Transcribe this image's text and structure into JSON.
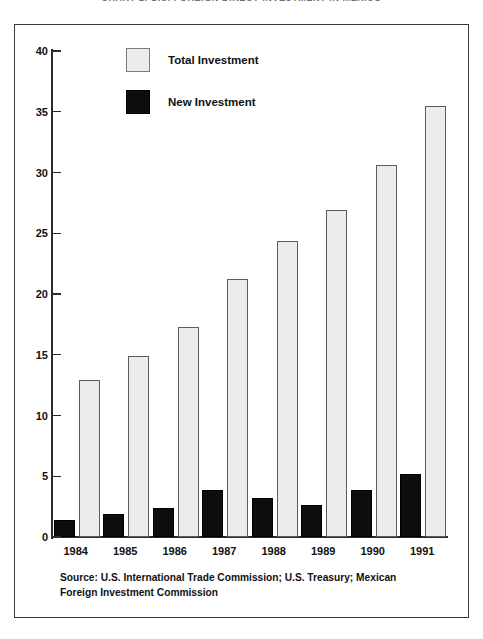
{
  "page": {
    "cropped_title": "CHART 2. U.S. FOREIGN DIRECT INVESTMENT IN MEXICO"
  },
  "legend": {
    "position": "top-center-inside",
    "items": [
      {
        "label": "Total Investment",
        "swatch": "light-gray-square",
        "color": "#ececed"
      },
      {
        "label": "New Investment",
        "swatch": "black-square",
        "color": "#0d0d0d"
      }
    ]
  },
  "source_note": "Source: U.S. International Trade Commission; U.S. Treasury; Mexican Foreign Investment Commission",
  "axis": {
    "y_ticks": [
      "0",
      "5",
      "10",
      "15",
      "20",
      "25",
      "30",
      "35",
      "40"
    ],
    "x_ticks": [
      "1984",
      "1985",
      "1986",
      "1987",
      "1988",
      "1989",
      "1990",
      "1991"
    ]
  },
  "chart_data": {
    "type": "bar",
    "title": "",
    "xlabel": "",
    "ylabel": "",
    "ylim": [
      0,
      40
    ],
    "ytick_values": [
      0,
      5,
      10,
      15,
      20,
      25,
      30,
      35,
      40
    ],
    "grid": false,
    "legend_position": "top-center",
    "categories": [
      "1984",
      "1985",
      "1986",
      "1987",
      "1988",
      "1989",
      "1990",
      "1991"
    ],
    "series": [
      {
        "name": "Total Investment",
        "color": "#ececed",
        "values": [
          12.9,
          14.9,
          17.3,
          21.2,
          24.4,
          26.9,
          30.6,
          35.5
        ]
      },
      {
        "name": "New Investment",
        "color": "#0d0d0d",
        "values": [
          1.4,
          1.9,
          2.4,
          3.9,
          3.2,
          2.6,
          3.9,
          5.2
        ]
      }
    ]
  }
}
